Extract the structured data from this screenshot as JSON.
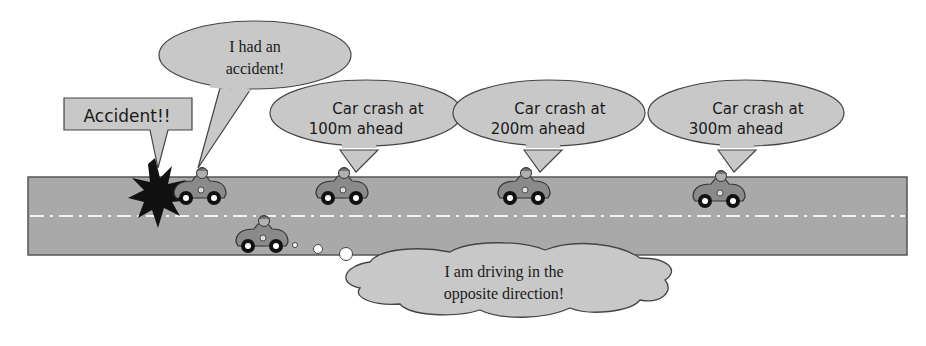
{
  "scene": {
    "title": "Accident warning propagation between vehicles",
    "colors": {
      "road": "#a9a9a9",
      "road_border": "#555555",
      "lane_marking": "#f2f2f2",
      "bubble_fill": "#c8c8c8",
      "bubble_stroke": "#444444",
      "text": "#1a1a1a",
      "explosion": "#111111"
    }
  },
  "labels": {
    "accident_callout": "Accident!!",
    "crashed_car_bubble": [
      "I had an",
      "accident!"
    ],
    "bubble_100m": [
      "Car crash at",
      "100m ahead"
    ],
    "bubble_200m": [
      "Car crash at",
      "200m ahead"
    ],
    "bubble_300m": [
      "Car crash at",
      "300m ahead"
    ],
    "opposite_car_thought": [
      "I am driving in the",
      "opposite direction!"
    ]
  },
  "vehicles": [
    {
      "id": "crashed",
      "lane": "top",
      "label_badge": "1"
    },
    {
      "id": "car-100m",
      "lane": "top",
      "label_badge": "1"
    },
    {
      "id": "car-200m",
      "lane": "top",
      "label_badge": "1"
    },
    {
      "id": "car-300m",
      "lane": "top",
      "label_badge": "1"
    },
    {
      "id": "opposite",
      "lane": "bottom",
      "label_badge": "1"
    }
  ]
}
